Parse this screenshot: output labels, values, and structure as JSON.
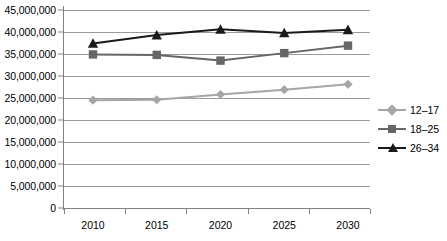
{
  "chart_data": {
    "type": "line",
    "title": "",
    "xlabel": "",
    "ylabel": "",
    "categories": [
      "2010",
      "2015",
      "2020",
      "2025",
      "2030"
    ],
    "series": [
      {
        "name": "12–17",
        "color": "#a6a6a6",
        "marker": "diamond",
        "values": [
          24500000,
          24600000,
          25800000,
          26900000,
          28100000
        ]
      },
      {
        "name": "18–25",
        "color": "#666666",
        "marker": "square",
        "values": [
          34900000,
          34800000,
          33500000,
          35200000,
          36900000
        ]
      },
      {
        "name": "26–34",
        "color": "#1a1a1a",
        "marker": "triangle",
        "values": [
          37400000,
          39300000,
          40600000,
          39800000,
          40500000
        ]
      }
    ],
    "ylim": [
      0,
      45000000
    ],
    "ytick_values": [
      0,
      5000000,
      10000000,
      15000000,
      20000000,
      25000000,
      30000000,
      35000000,
      40000000,
      45000000
    ],
    "ytick_labels": [
      "0",
      "5,000,000",
      "10,000,000",
      "15,000,000",
      "20,000,000",
      "25,000,000",
      "30,000,000",
      "35,000,000",
      "40,000,000",
      "45,000,000"
    ],
    "grid": true,
    "grid_axis": "y",
    "legend_position": "right",
    "background": "#ffffff",
    "grid_color": "#9a9a9a",
    "axis_color": "#808080"
  },
  "legend": {
    "entries": [
      {
        "label": "12–17"
      },
      {
        "label": "18–25"
      },
      {
        "label": "26–34"
      }
    ]
  }
}
